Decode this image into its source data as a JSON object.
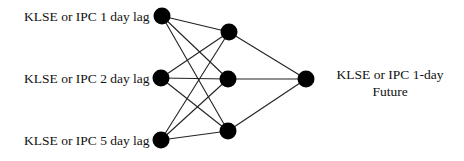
{
  "diagram": {
    "type": "neural-network",
    "colors": {
      "node": "#000000",
      "edge": "#222222",
      "text": "#111111",
      "background": "#ffffff"
    },
    "node_radius": 8.5,
    "layers": {
      "input": [
        {
          "id": "in1",
          "x": 162,
          "y": 16,
          "label": "KLSE or IPC 1 day lag"
        },
        {
          "id": "in2",
          "x": 161,
          "y": 78,
          "label": "KLSE or IPC 2 day lag"
        },
        {
          "id": "in3",
          "x": 161,
          "y": 140,
          "label": "KLSE or IPC 5 day lag"
        }
      ],
      "hidden": [
        {
          "id": "h1",
          "x": 229,
          "y": 32
        },
        {
          "id": "h2",
          "x": 228,
          "y": 79
        },
        {
          "id": "h3",
          "x": 228,
          "y": 131
        }
      ],
      "output": [
        {
          "id": "out1",
          "x": 306,
          "y": 79,
          "label_lines": [
            "KLSE or IPC 1-day",
            "Future"
          ]
        }
      ]
    },
    "edges": [
      [
        "in1",
        "h1"
      ],
      [
        "in1",
        "h2"
      ],
      [
        "in1",
        "h3"
      ],
      [
        "in2",
        "h1"
      ],
      [
        "in2",
        "h2"
      ],
      [
        "in2",
        "h3"
      ],
      [
        "in3",
        "h1"
      ],
      [
        "in3",
        "h2"
      ],
      [
        "in3",
        "h3"
      ],
      [
        "h1",
        "out1"
      ],
      [
        "h2",
        "out1"
      ],
      [
        "h3",
        "out1"
      ]
    ]
  },
  "labels": {
    "input_1": "KLSE or IPC 1 day lag",
    "input_2": "KLSE or IPC 2 day lag",
    "input_5": "KLSE or IPC 5 day lag",
    "output_line1": "KLSE or IPC 1-day",
    "output_line2": "Future"
  }
}
